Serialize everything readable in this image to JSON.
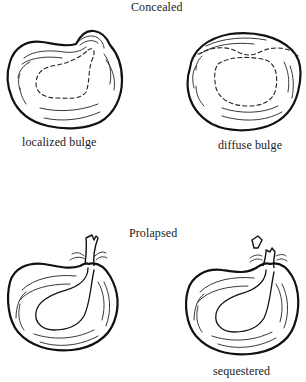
{
  "figure": {
    "sections": [
      {
        "heading": "Concealed",
        "items": [
          {
            "label": "localized bulge",
            "icon": "disc-localized-bulge"
          },
          {
            "label": "diffuse bulge",
            "icon": "disc-diffuse-bulge"
          }
        ]
      },
      {
        "heading": "Prolapsed",
        "items": [
          {
            "label": "",
            "icon": "disc-extrusion"
          },
          {
            "label": "sequestered",
            "icon": "disc-sequestered"
          }
        ]
      }
    ],
    "colors": {
      "ink": "#111111",
      "background": "#ffffff"
    }
  }
}
